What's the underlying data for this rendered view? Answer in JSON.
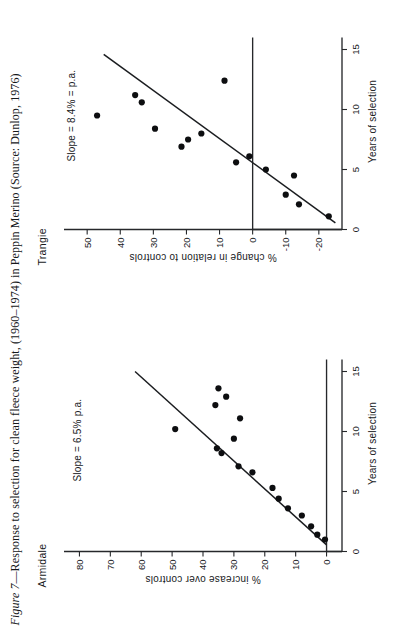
{
  "caption": {
    "figure_number": "Figure 7",
    "dash": "—",
    "text": "Response to selection for clean fleece weight, (1960–1974) in Peppin Merino (Source: Dunlop, 1976)",
    "full": "Figure 7—Response to selection for clean fleece weight, (1960–1974) in Peppin Merino (Source: Dunlop, 1976)"
  },
  "colors": {
    "ink": "#17191c",
    "dot": "#0d0e10",
    "line": "#1b1d20",
    "paper": "#ffffff"
  },
  "chart_data": [
    {
      "type": "scatter",
      "title": "Armidale",
      "annotation": "Slope = 6.5% p.a.",
      "xlabel": "Years of selection",
      "ylabel": "% increase over controls",
      "xlim": [
        0,
        16
      ],
      "ylim": [
        -5,
        85
      ],
      "xticks": [
        0,
        5,
        10,
        15
      ],
      "xticklabels": [
        "0",
        "5",
        "10",
        "15"
      ],
      "yticks": [
        0,
        10,
        20,
        30,
        40,
        50,
        60,
        70,
        80
      ],
      "yticklabels": [
        "0",
        "10",
        "20",
        "30",
        "40",
        "50",
        "60",
        "70",
        "80"
      ],
      "grid": false,
      "legend": false,
      "points": [
        {
          "x": 1.0,
          "y": 0.5
        },
        {
          "x": 1.4,
          "y": 3.0
        },
        {
          "x": 2.1,
          "y": 5.0
        },
        {
          "x": 3.0,
          "y": 8.0
        },
        {
          "x": 3.6,
          "y": 12.5
        },
        {
          "x": 4.4,
          "y": 15.5
        },
        {
          "x": 5.3,
          "y": 17.5
        },
        {
          "x": 6.6,
          "y": 24.0
        },
        {
          "x": 7.1,
          "y": 28.5
        },
        {
          "x": 8.2,
          "y": 34.0
        },
        {
          "x": 8.6,
          "y": 35.5
        },
        {
          "x": 9.4,
          "y": 30.0
        },
        {
          "x": 10.2,
          "y": 49.0
        },
        {
          "x": 11.1,
          "y": 28.0
        },
        {
          "x": 12.2,
          "y": 36.0
        },
        {
          "x": 12.9,
          "y": 32.5
        },
        {
          "x": 13.6,
          "y": 35.0
        }
      ],
      "trend": {
        "x0": 0.55,
        "y0": 0.0,
        "x1": 15.0,
        "y1": 62.0
      }
    },
    {
      "type": "scatter",
      "title": "Trangie",
      "annotation": "Slope = 8.4% = p.a.",
      "xlabel": "Years of selection",
      "ylabel": "% change in relation to controls",
      "xlim": [
        0,
        16
      ],
      "ylim": [
        -27,
        57
      ],
      "xticks": [
        0,
        5,
        10,
        15
      ],
      "xticklabels": [
        "0",
        "5",
        "10",
        "15"
      ],
      "yticks": [
        -20,
        -10,
        0,
        10,
        20,
        30,
        40,
        50
      ],
      "yticklabels": [
        "-20",
        "-10",
        "0",
        "10",
        "20",
        "30",
        "40",
        "50"
      ],
      "grid": false,
      "legend": false,
      "points": [
        {
          "x": 1.1,
          "y": -23.0
        },
        {
          "x": 2.1,
          "y": -14.0
        },
        {
          "x": 2.9,
          "y": -10.0
        },
        {
          "x": 4.5,
          "y": -12.5
        },
        {
          "x": 5.0,
          "y": -4.0
        },
        {
          "x": 5.6,
          "y": 5.0
        },
        {
          "x": 6.1,
          "y": 1.0
        },
        {
          "x": 6.9,
          "y": 21.5
        },
        {
          "x": 7.5,
          "y": 19.5
        },
        {
          "x": 8.0,
          "y": 15.5
        },
        {
          "x": 8.4,
          "y": 29.5
        },
        {
          "x": 9.5,
          "y": 47.0
        },
        {
          "x": 10.6,
          "y": 33.5
        },
        {
          "x": 11.2,
          "y": 35.5
        },
        {
          "x": 12.4,
          "y": 8.5
        }
      ],
      "trend": {
        "x0": 0.55,
        "y0": -25.0,
        "x1": 14.6,
        "y1": 45.0
      }
    }
  ]
}
